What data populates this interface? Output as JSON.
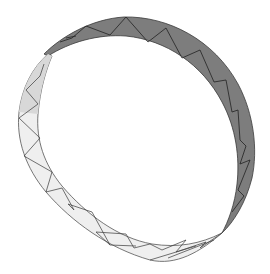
{
  "scene": {
    "description": "3D rendered triangulated ring band (twisted strip) on white background",
    "background": "#ffffff",
    "colors": {
      "back_face": "#7a7a7a",
      "front_face": "#eeeeee",
      "front_face_shaded": "#dcdcdc",
      "edge": "#2e2e2e",
      "edge_light": "#555555"
    }
  }
}
